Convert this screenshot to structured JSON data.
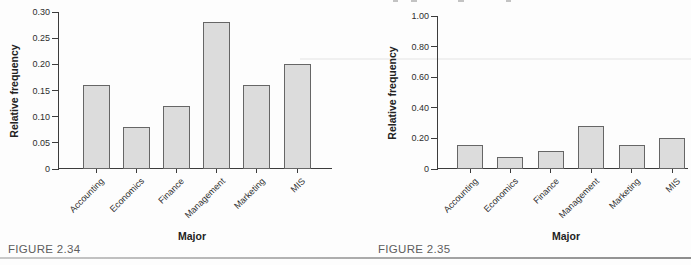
{
  "page": {
    "background": "#fdfdfd",
    "bottom_rule_color": "#9e9e9e",
    "axis_color": "#3c3c3c"
  },
  "figures": [
    {
      "caption": "FIGURE 2.34"
    },
    {
      "caption": "FIGURE 2.35"
    }
  ],
  "chart_data": [
    {
      "type": "bar",
      "title": "",
      "categories": [
        "Accounting",
        "Economics",
        "Finance",
        "Management",
        "Marketing",
        "MIS"
      ],
      "values": [
        0.16,
        0.08,
        0.12,
        0.28,
        0.16,
        0.2
      ],
      "xlabel": "Major",
      "ylabel": "Relative frequency",
      "ylim": [
        0,
        0.3
      ],
      "yticks": [
        0,
        0.05,
        0.1,
        0.15,
        0.2,
        0.25,
        0.3
      ],
      "ytick_labels": [
        "0",
        "0.05",
        "0.10",
        "0.15",
        "0.20",
        "0.25",
        "0.30"
      ],
      "grid": false,
      "legend": false,
      "bar_fill": "#dcdcdc",
      "bar_border": "#666666"
    },
    {
      "type": "bar",
      "title": "",
      "categories": [
        "Accounting",
        "Economics",
        "Finance",
        "Management",
        "Marketing",
        "MIS"
      ],
      "values": [
        0.16,
        0.08,
        0.12,
        0.28,
        0.16,
        0.2
      ],
      "xlabel": "Major",
      "ylabel": "Relative frequency",
      "ylim": [
        0,
        1.0
      ],
      "yticks": [
        0,
        0.2,
        0.4,
        0.6,
        0.8,
        1.0
      ],
      "ytick_labels": [
        "0",
        "0.20",
        "0.40",
        "0.60",
        "0.80",
        "1.00"
      ],
      "grid": false,
      "legend": false,
      "bar_fill": "#dcdcdc",
      "bar_border": "#666666"
    }
  ]
}
